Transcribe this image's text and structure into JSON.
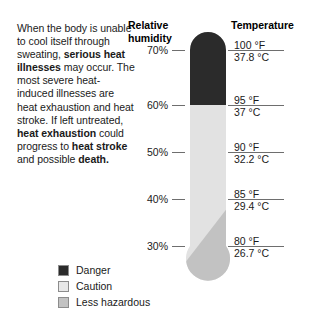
{
  "narrative": {
    "segments": [
      {
        "text": "When the body is unable to cool itself through sweating, ",
        "bold": false
      },
      {
        "text": "serious heat illnesses",
        "bold": true
      },
      {
        "text": " may occur. The most severe heat-induced illnesses are heat exhaustion and heat stroke. If left untreated, ",
        "bold": false
      },
      {
        "text": "heat exhaustion",
        "bold": true
      },
      {
        "text": " could progress to ",
        "bold": false
      },
      {
        "text": "heat stroke",
        "bold": true
      },
      {
        "text": " and possible ",
        "bold": false
      },
      {
        "text": "death.",
        "bold": true
      }
    ],
    "plain_text": "When the body is unable to cool itself through sweating, serious heat illnesses may occur. The most severe heat-induced illnesses are heat exhaustion and heat stroke. If left untreated, heat exhaustion could progress to heat stroke and possible death."
  },
  "headings": {
    "humidity": "Relative humidity",
    "humidity_line1": "Relative",
    "humidity_line2": "humidity",
    "temperature": "Temperature"
  },
  "colors": {
    "danger": "#2b2b2b",
    "caution": "#e2e2e2",
    "less_hazardous": "#c2c2c2",
    "tick": "#6e6e6e",
    "text": "#1a1a1a"
  },
  "legend": {
    "items": [
      {
        "label": "Danger",
        "color": "#2b2b2b",
        "swatch": "danger-swatch"
      },
      {
        "label": "Caution",
        "color": "#e8e8e8",
        "swatch": "caution-swatch"
      },
      {
        "label": "Less hazardous",
        "color": "#c2c2c2",
        "swatch": "less-hazardous-swatch"
      }
    ]
  },
  "chart_data": {
    "type": "bar",
    "subtitle": "Relative humidity versus temperature risk bands",
    "xlabel": "",
    "ylabel": "",
    "grid": false,
    "legend_position": "bottom-left",
    "categories": [
      "70%",
      "60%",
      "50%",
      "40%",
      "30%"
    ],
    "axes": [
      {
        "name": "Relative humidity",
        "unit": "%",
        "tick_labels": [
          "70%",
          "60%",
          "50%",
          "40%",
          "30%"
        ],
        "values": [
          70,
          60,
          50,
          40,
          30
        ],
        "position": "left"
      },
      {
        "name": "Temperature",
        "tick_labels_f": [
          "100 °F",
          "95 °F",
          "90 °F",
          "85 °F",
          "80 °F"
        ],
        "tick_labels_c": [
          "37.8 °C",
          "37 °C",
          "32.2 °C",
          "29.4 °C",
          "26.7 °C"
        ],
        "values_f": [
          100,
          95,
          90,
          85,
          80
        ],
        "values_c": [
          37.8,
          37,
          32.2,
          29.4,
          26.7
        ],
        "position": "right"
      }
    ],
    "rows": [
      {
        "humidity": "70%",
        "temp_f": "100 °F",
        "temp_c": "37.8 °C",
        "band": "Danger",
        "y": 50
      },
      {
        "humidity": "60%",
        "temp_f": "95 °F",
        "temp_c": "37 °C",
        "band": "Danger",
        "y": 105
      },
      {
        "humidity": "50%",
        "temp_f": "90 °F",
        "temp_c": "32.2 °C",
        "band": "Caution",
        "y": 152
      },
      {
        "humidity": "40%",
        "temp_f": "85 °F",
        "temp_c": "29.4 °C",
        "band": "Caution",
        "y": 199
      },
      {
        "humidity": "30%",
        "temp_f": "80 °F",
        "temp_c": "26.7 °C",
        "band": "Less hazardous",
        "y": 246
      }
    ],
    "bands": [
      {
        "name": "Danger",
        "color": "#2b2b2b",
        "humidity_range": [
          60,
          70
        ],
        "temp_range_f": [
          95,
          100
        ]
      },
      {
        "name": "Caution",
        "color": "#e2e2e2",
        "humidity_range": [
          30,
          60
        ],
        "temp_range_f": [
          80,
          95
        ]
      },
      {
        "name": "Less hazardous",
        "color": "#c2c2c2",
        "humidity_range": [
          0,
          40
        ],
        "temp_range_f": [
          0,
          85
        ]
      }
    ]
  }
}
